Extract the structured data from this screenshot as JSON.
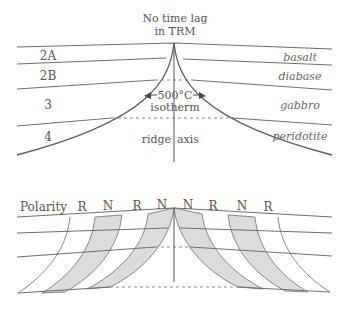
{
  "top_diagram": {
    "title_line1": "No time lag",
    "title_line2": "in TRM",
    "layers_left": [
      "2A",
      "2B",
      "3",
      "4"
    ],
    "layers_right": [
      "basalt",
      "diabase",
      "gabbro",
      "peridotite"
    ],
    "isotherm_line1": "500°C",
    "isotherm_line2": "isotherm",
    "axis_left": "ridge",
    "axis_right": "axis"
  },
  "bottom_diagram": {
    "polarity_label": "Polarity",
    "polarities": [
      "R",
      "N",
      "R",
      "N",
      "N",
      "R",
      "N",
      "R"
    ],
    "shaded_polarity": "N",
    "colors": {
      "shaded": "#dcdcdc",
      "line": "#6e6e6e"
    }
  }
}
